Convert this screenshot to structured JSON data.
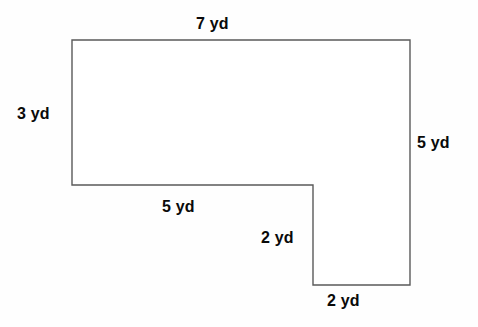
{
  "figure": {
    "name": "composite-l-shape",
    "unit": "yd",
    "stroke_color": "#5a5a5a",
    "fill_color": "#ffffff",
    "background_color": "#fefefe",
    "text_color": "#0a0a0a",
    "vertices": [
      [
        72,
        40
      ],
      [
        410,
        40
      ],
      [
        410,
        285
      ],
      [
        313,
        285
      ],
      [
        313,
        185
      ],
      [
        72,
        185
      ]
    ],
    "labels": {
      "top": "7 yd",
      "left": "3 yd",
      "right": "5 yd",
      "middle_bottom": "5 yd",
      "notch_vertical": "2 yd",
      "bottom": "2 yd"
    }
  },
  "chart_data": {
    "type": "diagram",
    "title": "",
    "shape": "L-shaped polygon (rectilinear composite figure)",
    "unit": "yd",
    "sides": [
      {
        "name": "top",
        "label": "7 yd",
        "value": 7,
        "orientation": "horizontal",
        "from": [
          72,
          40
        ],
        "to": [
          410,
          40
        ]
      },
      {
        "name": "right",
        "label": "5 yd",
        "value": 5,
        "orientation": "vertical",
        "from": [
          410,
          40
        ],
        "to": [
          410,
          285
        ]
      },
      {
        "name": "bottom",
        "label": "2 yd",
        "value": 2,
        "orientation": "horizontal",
        "from": [
          410,
          285
        ],
        "to": [
          313,
          285
        ]
      },
      {
        "name": "notch-vertical",
        "label": "2 yd",
        "value": 2,
        "orientation": "vertical",
        "from": [
          313,
          285
        ],
        "to": [
          313,
          185
        ]
      },
      {
        "name": "middle-bottom",
        "label": "5 yd",
        "value": 5,
        "orientation": "horizontal",
        "from": [
          313,
          185
        ],
        "to": [
          72,
          185
        ]
      },
      {
        "name": "left",
        "label": "3 yd",
        "value": 3,
        "orientation": "vertical",
        "from": [
          72,
          185
        ],
        "to": [
          72,
          40
        ]
      }
    ]
  }
}
